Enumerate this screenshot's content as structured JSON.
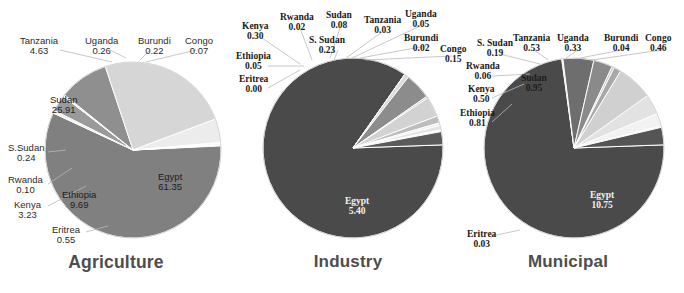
{
  "figure": {
    "background": "#ffffff",
    "width": 684,
    "height": 293,
    "label_line_color": "#b9b9b9"
  },
  "chart_data": [
    {
      "type": "pie",
      "title": "Agriculture",
      "units": "percent",
      "start_angle_deg": -3,
      "direction": "clockwise",
      "center": [
        133,
        150
      ],
      "radius": 88,
      "categories": [
        "Egypt",
        "Eritrea",
        "Kenya",
        "Rwanda",
        "S.Sudan",
        "Ethiopia",
        "Sudan",
        "Tanzania",
        "Uganda",
        "Burundi",
        "Congo"
      ],
      "labels": [
        "Egypt",
        "Eritrea",
        "Kenya",
        "Rwanda",
        "S.Sudan",
        "Ethiopia",
        "Sudan",
        "Tanzania",
        "Uganda",
        "Burundi",
        "Congo"
      ],
      "values": [
        61.35,
        0.55,
        3.23,
        0.1,
        0.24,
        9.69,
        25.91,
        4.63,
        0.26,
        0.22,
        0.07
      ],
      "value_strings": [
        "61.35",
        "0.55",
        "3.23",
        "0.10",
        "0.24",
        "9.69",
        "25.91",
        "4.63",
        "0.26",
        "0.22",
        "0.07"
      ],
      "slice_colors": [
        "#808080",
        "#f2f2f2",
        "#9a9a9a",
        "#e8e8e8",
        "#b4b4b4",
        "#8f8f8f",
        "#d6d6d6",
        "#ececec",
        "#fbfbfb",
        "#e0e0e0",
        "#f6f6f6"
      ],
      "legend": "none",
      "grid": false
    },
    {
      "type": "pie",
      "title": "Industry",
      "units": "percent",
      "start_angle_deg": -2,
      "direction": "clockwise",
      "center": [
        353,
        148
      ],
      "radius": 90,
      "categories": [
        "Egypt",
        "Eritrea",
        "Ethiopia",
        "Kenya",
        "Rwanda",
        "S. Sudan",
        "Sudan",
        "Tanzania",
        "Uganda",
        "Burundi",
        "Congo"
      ],
      "labels": [
        "Egypt",
        "Eritrea",
        "Ethiopia",
        "Kenya",
        "Rwanda",
        "S. Sudan",
        "Sudan",
        "Tanzania",
        "Uganda",
        "Burundi",
        "Congo"
      ],
      "values": [
        5.4,
        0.0,
        0.05,
        0.3,
        0.02,
        0.23,
        0.08,
        0.03,
        0.05,
        0.02,
        0.15
      ],
      "value_strings": [
        "5.40",
        "0.00",
        "0.05",
        "0.30",
        "0.02",
        "0.23",
        "0.08",
        "0.03",
        "0.05",
        "0.02",
        "0.15"
      ],
      "slice_colors": [
        "#4a4a4a",
        "#eeeeee",
        "#dcdcdc",
        "#8c8c8c",
        "#c8c8c8",
        "#d2d2d2",
        "#bdbdbd",
        "#efefef",
        "#e4e4e4",
        "#ffffff",
        "#5a5a5a"
      ],
      "legend": "none",
      "grid": false
    },
    {
      "type": "pie",
      "title": "Municipal",
      "units": "percent",
      "start_angle_deg": -2,
      "direction": "clockwise",
      "center": [
        574,
        148
      ],
      "radius": 90,
      "categories": [
        "Egypt",
        "Eritrea",
        "Ethiopia",
        "Kenya",
        "Rwanda",
        "S. Sudan",
        "Sudan",
        "Tanzania",
        "Uganda",
        "Burundi",
        "Congo"
      ],
      "labels": [
        "Egypt",
        "Eritrea",
        "Ethiopia",
        "Kenya",
        "Rwanda",
        "S. Sudan",
        "Sudan",
        "Tanzania",
        "Uganda",
        "Burundi",
        "Congo"
      ],
      "values": [
        10.75,
        0.03,
        0.81,
        0.5,
        0.06,
        0.19,
        0.95,
        0.53,
        0.33,
        0.04,
        0.46
      ],
      "value_strings": [
        "10.75",
        "0.03",
        "0.81",
        "0.50",
        "0.06",
        "0.19",
        "0.95",
        "0.53",
        "0.33",
        "0.04",
        "0.46"
      ],
      "slice_colors": [
        "#4a4a4a",
        "#efefef",
        "#6e6e6e",
        "#8a8a8a",
        "#c6c6c6",
        "#a8a8a8",
        "#d0d0d0",
        "#e2e2e2",
        "#f2f2f2",
        "#fafafa",
        "#555555"
      ],
      "legend": "none",
      "grid": false
    }
  ],
  "panels": [
    {
      "title": "Agriculture",
      "title_pos": [
        35,
        253
      ],
      "labels": [
        {
          "name": "Tanzania",
          "value": "4.63",
          "x": 20,
          "y": 36,
          "inside": false
        },
        {
          "name": "Uganda",
          "value": "0.26",
          "x": 85,
          "y": 36,
          "inside": false
        },
        {
          "name": "Burundi",
          "value": "0.22",
          "x": 138,
          "y": 36,
          "inside": false
        },
        {
          "name": "Congo",
          "value": "0.07",
          "x": 185,
          "y": 36,
          "inside": false
        },
        {
          "name": "Sudan",
          "value": "25.91",
          "x": 50,
          "y": 95,
          "inside": true
        },
        {
          "name": "S.Sudan",
          "value": "0.24",
          "x": 8,
          "y": 143,
          "inside": false
        },
        {
          "name": "Rwanda",
          "value": "0.10",
          "x": 8,
          "y": 175,
          "inside": false
        },
        {
          "name": "Kenya",
          "value": "3.23",
          "x": 14,
          "y": 200,
          "inside": false
        },
        {
          "name": "Ethiopia",
          "value": "9.69",
          "x": 62,
          "y": 190,
          "inside": true
        },
        {
          "name": "Eritrea",
          "value": "0.55",
          "x": 52,
          "y": 225,
          "inside": false
        },
        {
          "name": "Egypt",
          "value": "61.35",
          "x": 158,
          "y": 172,
          "inside": true
        }
      ]
    },
    {
      "title": "Industry",
      "title_pos": [
        306,
        253
      ],
      "labels": [
        {
          "name": "Kenya",
          "value": "0.30",
          "x": 242,
          "y": 21,
          "inside": false
        },
        {
          "name": "Rwanda",
          "value": "0.02",
          "x": 280,
          "y": 12,
          "inside": false
        },
        {
          "name": "Sudan",
          "value": "0.08",
          "x": 326,
          "y": 10,
          "inside": false
        },
        {
          "name": "S. Sudan",
          "value": "0.23",
          "x": 309,
          "y": 35,
          "inside": false
        },
        {
          "name": "Tanzania",
          "value": "0.03",
          "x": 364,
          "y": 15,
          "inside": false
        },
        {
          "name": "Uganda",
          "value": "0.05",
          "x": 405,
          "y": 9,
          "inside": false
        },
        {
          "name": "Burundi",
          "value": "0.02",
          "x": 404,
          "y": 33,
          "inside": false
        },
        {
          "name": "Congo",
          "value": "0.15",
          "x": 440,
          "y": 44,
          "inside": false
        },
        {
          "name": "Ethiopia",
          "value": "0.05",
          "x": 236,
          "y": 51,
          "inside": false
        },
        {
          "name": "Eritrea",
          "value": "0.00",
          "x": 239,
          "y": 74,
          "inside": false
        },
        {
          "name": "Egypt",
          "value": "5.40",
          "x": 345,
          "y": 196,
          "inside": true,
          "onDark": true
        }
      ]
    },
    {
      "title": "Municipal",
      "title_pos": [
        528,
        253
      ],
      "labels": [
        {
          "name": "S. Sudan",
          "value": "0.19",
          "x": 477,
          "y": 38,
          "inside": false
        },
        {
          "name": "Tanzania",
          "value": "0.53",
          "x": 513,
          "y": 33,
          "inside": false
        },
        {
          "name": "Uganda",
          "value": "0.33",
          "x": 557,
          "y": 33,
          "inside": false
        },
        {
          "name": "Burundi",
          "value": "0.04",
          "x": 604,
          "y": 33,
          "inside": false
        },
        {
          "name": "Congo",
          "value": "0.46",
          "x": 645,
          "y": 33,
          "inside": false
        },
        {
          "name": "Rwanda",
          "value": "0.06",
          "x": 466,
          "y": 61,
          "inside": false
        },
        {
          "name": "Kenya",
          "value": "0.50",
          "x": 468,
          "y": 84,
          "inside": false
        },
        {
          "name": "Sudan",
          "value": "0.95",
          "x": 521,
          "y": 73,
          "inside": true
        },
        {
          "name": "Ethiopia",
          "value": "0.81",
          "x": 460,
          "y": 108,
          "inside": false
        },
        {
          "name": "Eritrea",
          "value": "0.03",
          "x": 467,
          "y": 229,
          "inside": false
        },
        {
          "name": "Egypt",
          "value": "10.75",
          "x": 590,
          "y": 190,
          "inside": true,
          "onDark": true
        }
      ]
    }
  ]
}
